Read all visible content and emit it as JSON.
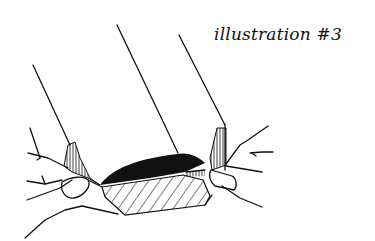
{
  "caption": "illustration #3",
  "illustration": {
    "subject": "two hands pinching the folded edge of a fabric / paper sleeve",
    "colors": {
      "ink": "#111111",
      "paper": "#ffffff"
    }
  }
}
